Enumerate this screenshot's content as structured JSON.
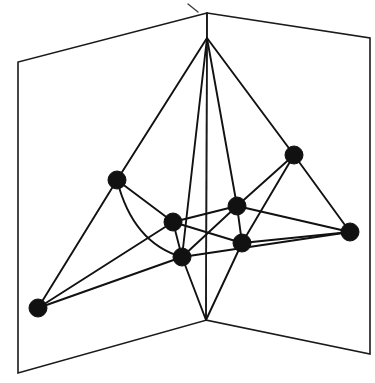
{
  "figure": {
    "caption": "",
    "background_color": "#ffffff",
    "ink_color": "#111111",
    "canvas": {
      "width": 375,
      "height": 383
    }
  },
  "surface": {
    "type": "two-panel-fold",
    "fold_line": {
      "top": [
        207,
        13
      ],
      "bottom": [
        206,
        320
      ]
    },
    "left_panel": {
      "name": "left-half-plane",
      "points": "207,13 207,320 18,373 18,62"
    },
    "right_panel": {
      "name": "right-half-plane",
      "points": "207,13 370,38 370,354 206,320"
    }
  },
  "chart_data": {
    "type": "scatter",
    "xlabel": "",
    "ylabel": "",
    "xlim": [
      0,
      375
    ],
    "ylim": [
      0,
      383
    ],
    "grid": false,
    "legend": null,
    "node_count": 10,
    "edge_count": 22,
    "node_radius": 9,
    "nodes": [
      {
        "id": "apex",
        "label": "",
        "x": 207,
        "y": 38,
        "rendered": false
      },
      {
        "id": "foot",
        "label": "",
        "x": 206,
        "y": 320,
        "rendered": false
      },
      {
        "id": "n1",
        "label": "",
        "x": 117,
        "y": 180,
        "rendered": true
      },
      {
        "id": "n2",
        "label": "",
        "x": 294,
        "y": 155,
        "rendered": true
      },
      {
        "id": "n3",
        "label": "",
        "x": 173,
        "y": 222,
        "rendered": true
      },
      {
        "id": "n4",
        "label": "",
        "x": 237,
        "y": 206,
        "rendered": true
      },
      {
        "id": "n5",
        "label": "",
        "x": 242,
        "y": 243,
        "rendered": true
      },
      {
        "id": "n6",
        "label": "",
        "x": 182,
        "y": 257,
        "rendered": true
      },
      {
        "id": "n7",
        "label": "",
        "x": 350,
        "y": 232,
        "rendered": true
      },
      {
        "id": "n8",
        "label": "",
        "x": 38,
        "y": 308,
        "rendered": true
      }
    ],
    "edges": [
      {
        "from": "apex",
        "to": "n1",
        "curved": false
      },
      {
        "from": "apex",
        "to": "n2",
        "curved": false
      },
      {
        "from": "apex",
        "to": "n4",
        "curved": false
      },
      {
        "from": "apex",
        "to": "n6",
        "curved": false
      },
      {
        "from": "n1",
        "to": "n3",
        "curved": false
      },
      {
        "from": "n1",
        "to": "n8",
        "curved": false
      },
      {
        "from": "n1",
        "to": "n6",
        "curved": true,
        "control": [
          133,
          243
        ]
      },
      {
        "from": "n3",
        "to": "n4",
        "curved": false
      },
      {
        "from": "n3",
        "to": "n6",
        "curved": false
      },
      {
        "from": "n3",
        "to": "n5",
        "curved": false
      },
      {
        "from": "n3",
        "to": "n8",
        "curved": false
      },
      {
        "from": "n4",
        "to": "n5",
        "curved": false
      },
      {
        "from": "n4",
        "to": "n6",
        "curved": false
      },
      {
        "from": "n4",
        "to": "n2",
        "curved": false
      },
      {
        "from": "n4",
        "to": "n7",
        "curved": false
      },
      {
        "from": "n5",
        "to": "n2",
        "curved": false
      },
      {
        "from": "n5",
        "to": "n7",
        "curved": false
      },
      {
        "from": "n5",
        "to": "foot",
        "curved": false
      },
      {
        "from": "n6",
        "to": "foot",
        "curved": false
      },
      {
        "from": "n6",
        "to": "n8",
        "curved": false
      },
      {
        "from": "n6",
        "to": "n7",
        "curved": false
      },
      {
        "from": "n2",
        "to": "n7",
        "curved": false
      }
    ]
  },
  "annotations": {
    "stray_pen_mark": {
      "present": true,
      "path": "M 188 4 L 198 12"
    }
  }
}
